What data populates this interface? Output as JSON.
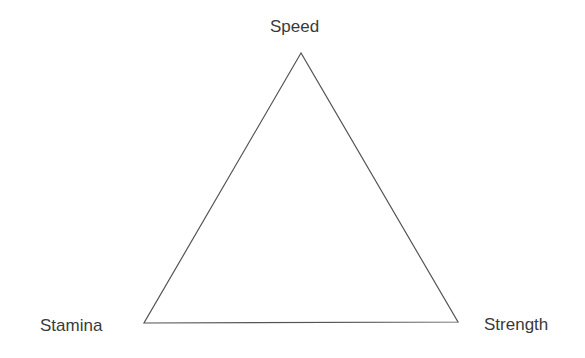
{
  "diagram": {
    "type": "triangle",
    "vertices": [
      {
        "label": "Speed",
        "position": "top"
      },
      {
        "label": "Stamina",
        "position": "bottom-left"
      },
      {
        "label": "Strength",
        "position": "bottom-right"
      }
    ],
    "stroke_color": "#555555"
  }
}
